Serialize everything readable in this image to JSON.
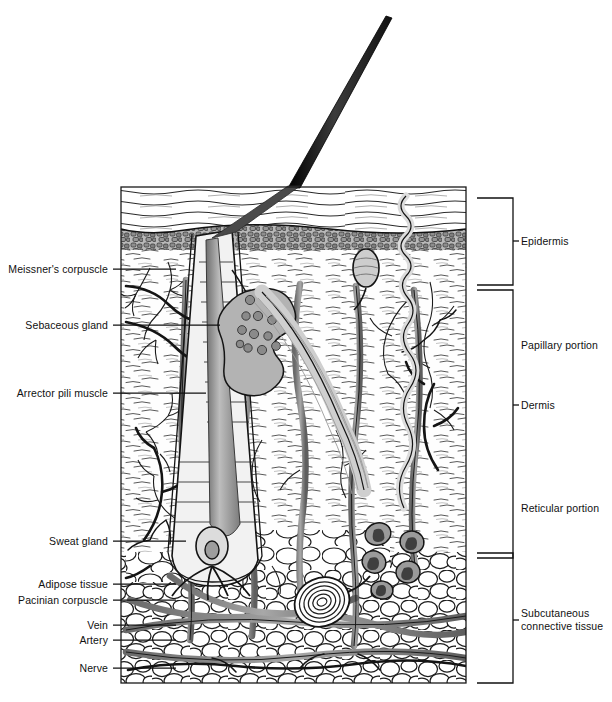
{
  "figure": {
    "type": "anatomical-diagram",
    "frame": {
      "x": 121,
      "y": 187,
      "width": 345,
      "height": 496
    },
    "ink_colors": {
      "outline": "#111111",
      "mid_gray": "#8d8d8d",
      "light_gray": "#c9c9c9",
      "dark_gray": "#5a5a5a",
      "paper": "#ffffff"
    }
  },
  "left_labels": [
    {
      "id": "meissners-corpuscle",
      "text": "Meissner's corpuscle",
      "text_x": 108,
      "y": 269,
      "leader_to_x": 176
    },
    {
      "id": "sebaceous-gland",
      "text": "Sebaceous gland",
      "text_x": 108,
      "y": 325,
      "leader_to_x": 220
    },
    {
      "id": "arrector-pili-muscle",
      "text": "Arrector pili muscle",
      "text_x": 108,
      "y": 393,
      "leader_to_x": 206
    },
    {
      "id": "sweat-gland",
      "text": "Sweat gland",
      "text_x": 108,
      "y": 541,
      "leader_to_x": 186
    },
    {
      "id": "adipose-tissue",
      "text": "Adipose tissue",
      "text_x": 108,
      "y": 584,
      "leader_to_x": 176
    },
    {
      "id": "pacinian-corpuscle",
      "text": "Pacinian corpuscle",
      "text_x": 108,
      "y": 600,
      "leader_to_x": 176
    },
    {
      "id": "vein",
      "text": "Vein",
      "text_x": 108,
      "y": 625,
      "leader_to_x": 176
    },
    {
      "id": "artery",
      "text": "Artery",
      "text_x": 108,
      "y": 640,
      "leader_to_x": 176
    },
    {
      "id": "nerve",
      "text": "Nerve",
      "text_x": 108,
      "y": 668,
      "leader_to_x": 176
    }
  ],
  "right_brackets": [
    {
      "id": "epidermis",
      "text": "Epidermis",
      "top": 198,
      "bottom": 285,
      "tick_y": 241,
      "spine_x": 513,
      "arm_x": 477,
      "text_x": 521,
      "multiline": false
    },
    {
      "id": "dermis",
      "text": "Dermis",
      "top": 290,
      "bottom": 558,
      "tick_y": 405,
      "spine_x": 513,
      "arm_x": 477,
      "text_x": 521,
      "multiline": false
    },
    {
      "id": "subcutaneous-connective-tissue",
      "text": "Subcutaneous connective tissue",
      "top": 553,
      "bottom": 683,
      "tick_y": 620,
      "spine_x": 513,
      "arm_x": 477,
      "text_x": 521,
      "multiline": true
    }
  ],
  "right_inner_labels": [
    {
      "id": "papillary-portion",
      "text": "Papillary portion",
      "x": 521,
      "y": 345
    },
    {
      "id": "reticular-portion",
      "text": "Reticular portion",
      "x": 521,
      "y": 508
    }
  ],
  "anatomy_regions": [
    {
      "id": "stratum-corneum",
      "label": "stratum corneum",
      "y_top": 187,
      "y_bottom": 231
    },
    {
      "id": "epidermis-cellular",
      "label": "cellular epidermis",
      "y_top": 231,
      "y_bottom": 285
    },
    {
      "id": "papillary-dermis",
      "label": "papillary dermis",
      "y_top": 285,
      "y_bottom": 430
    },
    {
      "id": "reticular-dermis",
      "label": "reticular dermis",
      "y_top": 430,
      "y_bottom": 558
    },
    {
      "id": "hypodermis",
      "label": "subcutaneous fat",
      "y_top": 558,
      "y_bottom": 683
    }
  ],
  "structures": {
    "hair_shaft": {
      "tip_x": 392,
      "tip_y": 18,
      "base_x": 297,
      "base_y": 187
    },
    "hair_follicle": {
      "bulb_x": 212,
      "bulb_y": 545
    },
    "sebaceous_gland": {
      "x": 258,
      "y": 330
    },
    "sweat_duct": {
      "x": 406,
      "y": 210
    },
    "pacinian_corpuscle": {
      "x": 320,
      "y": 600
    },
    "sweat_gland_coil": {
      "x": 388,
      "y": 545
    }
  }
}
